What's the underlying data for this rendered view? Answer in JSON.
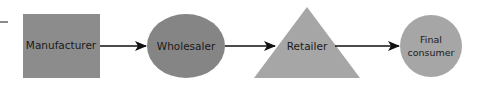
{
  "diagram": {
    "type": "flow",
    "nodes": [
      {
        "id": "manufacturer",
        "label": "Manufacturer",
        "shape": "square",
        "color": "#8c8c8c"
      },
      {
        "id": "wholesaler",
        "label": "Wholesaler",
        "shape": "ellipse",
        "color": "#858585"
      },
      {
        "id": "retailer",
        "label": "Retailer",
        "shape": "triangle",
        "color": "#a6a6a6"
      },
      {
        "id": "final_consumer",
        "label_line1": "Final",
        "label_line2": "consumer",
        "shape": "circle",
        "color": "#a6a6a6"
      }
    ],
    "edges": [
      {
        "from": "manufacturer",
        "to": "wholesaler"
      },
      {
        "from": "wholesaler",
        "to": "retailer"
      },
      {
        "from": "retailer",
        "to": "final_consumer"
      }
    ],
    "colors": {
      "arrow": "#111111",
      "leader_dash": "#666666"
    }
  }
}
